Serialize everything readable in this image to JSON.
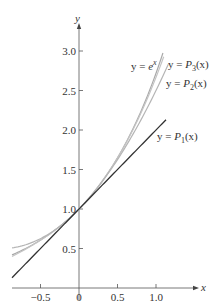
{
  "chart_data": {
    "type": "line",
    "title": "",
    "xlabel": "x",
    "ylabel": "y",
    "xlim": [
      -0.87,
      1.45
    ],
    "ylim": [
      0,
      3.3
    ],
    "grid": false,
    "legend_position": "inline annotations",
    "x_ticks": [
      -0.5,
      0,
      0.5,
      1.0
    ],
    "x_tick_labels": [
      "−0.5",
      "0",
      "0.5",
      "1.0"
    ],
    "y_ticks": [
      0.5,
      1.0,
      1.5,
      2.0,
      2.5,
      3.0
    ],
    "y_tick_labels": [
      "0.5",
      "1.0",
      "1.5",
      "2.0",
      "2.5",
      "3.0"
    ],
    "series": [
      {
        "name": "y = e^x",
        "formula": "exp(x)",
        "color": "#a9a9a9",
        "x_range": [
          -0.87,
          1.09
        ]
      },
      {
        "name": "y = P3(x)",
        "formula": "1 + x + x^2/2 + x^3/6",
        "color": "#c4c4c4",
        "x_range": [
          -0.87,
          1.1
        ]
      },
      {
        "name": "y = P2(x)",
        "formula": "1 + x + x^2/2",
        "color": "#b5b5b5",
        "x_range": [
          -0.87,
          1.16
        ]
      },
      {
        "name": "y = P1(x)",
        "formula": "1 + x",
        "color": "#333333",
        "x_range": [
          -0.87,
          1.13
        ]
      }
    ],
    "annotations": [
      "y = e^x",
      "y = P3(x)",
      "y = P2(x)",
      "y = P1(x)"
    ]
  },
  "axes": {
    "x_label": "x",
    "y_label": "y"
  },
  "labels": {
    "ex": {
      "pre": "y = ",
      "base": "e",
      "sup": "x"
    },
    "p3": {
      "pre": "y = ",
      "P": "P",
      "sub": "3",
      "post": "(x)"
    },
    "p2": {
      "pre": "y = ",
      "P": "P",
      "sub": "2",
      "post": "(x)"
    },
    "p1": {
      "pre": "y = ",
      "P": "P",
      "sub": "1",
      "post": "(x)"
    }
  }
}
